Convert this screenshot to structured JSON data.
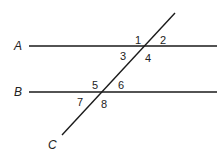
{
  "diagram": {
    "type": "parallel-lines-transversal",
    "colors": {
      "line": "#1a1a1a",
      "text": "#222222",
      "background": "#ffffff"
    },
    "lines": [
      {
        "name": "A",
        "label": "A",
        "x1": 29,
        "y1": 46,
        "x2": 217,
        "y2": 46,
        "label_x": 14,
        "label_y": 50
      },
      {
        "name": "B",
        "label": "B",
        "x1": 29,
        "y1": 92,
        "x2": 217,
        "y2": 92,
        "label_x": 14,
        "label_y": 96
      },
      {
        "name": "C",
        "label": "C",
        "x1": 62,
        "y1": 135,
        "x2": 175,
        "y2": 13,
        "label_x": 48,
        "label_y": 149
      }
    ],
    "angles": [
      {
        "label": "1",
        "x": 135,
        "y": 44
      },
      {
        "label": "2",
        "x": 160,
        "y": 44
      },
      {
        "label": "3",
        "x": 120,
        "y": 60
      },
      {
        "label": "4",
        "x": 145,
        "y": 62
      },
      {
        "label": "5",
        "x": 92,
        "y": 89
      },
      {
        "label": "6",
        "x": 118,
        "y": 89
      },
      {
        "label": "7",
        "x": 77,
        "y": 106
      },
      {
        "label": "8",
        "x": 101,
        "y": 108
      }
    ]
  }
}
